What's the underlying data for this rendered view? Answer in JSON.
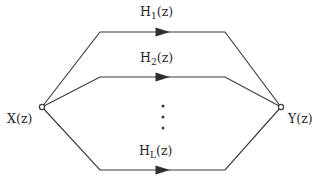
{
  "figure": {
    "kind": "signal-flow-diagram",
    "background_color": "#ffffff",
    "stroke_color": "#3a3a42",
    "text_color": "#26262c"
  },
  "nodes": {
    "input": {
      "name": "input-node",
      "label_base": "X",
      "label_arg": "(z)",
      "label_full": "X(z)",
      "x": 42,
      "y": 107
    },
    "output": {
      "name": "output-node",
      "label_base": "Y",
      "label_arg": "(z)",
      "label_full": "Y(z)",
      "x": 281,
      "y": 107
    }
  },
  "branches": [
    {
      "id": "branch-h1",
      "label_base": "H",
      "label_sub": "1",
      "label_arg": "(z)",
      "label_full": "H1(z)",
      "line_y": 32,
      "arrow_x": 168
    },
    {
      "id": "branch-h2",
      "label_base": "H",
      "label_sub": "2",
      "label_arg": "(z)",
      "label_full": "H2(z)",
      "line_y": 77,
      "arrow_x": 168
    },
    {
      "id": "branch-hl",
      "label_base": "H",
      "label_sub": "L",
      "label_arg": "(z)",
      "label_full": "HL(z)",
      "line_y": 170,
      "arrow_x": 168
    }
  ],
  "ellipsis": {
    "name": "vertical-ellipsis",
    "glyph": "⋮",
    "dot_count": 3,
    "x": 163,
    "y_positions": [
      106,
      117,
      128
    ]
  },
  "geometry": {
    "horizontal_start_x": 100,
    "horizontal_end_x": 225,
    "canvas_width": 325,
    "canvas_height": 188
  }
}
